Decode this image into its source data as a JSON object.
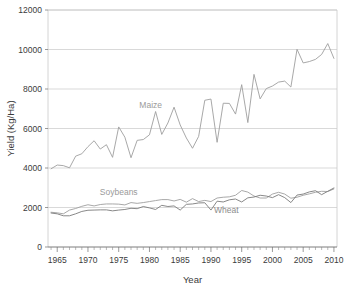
{
  "chart_data": {
    "type": "line",
    "title": "",
    "xlabel": "Year",
    "ylabel": "Yield (Kg/Ha)",
    "xlim": [
      1963.5,
      2010.5
    ],
    "ylim": [
      0,
      12000
    ],
    "grid": true,
    "legend_position": "inline-annotations",
    "x_tick_labels": [
      "1965",
      "1970",
      "1975",
      "1980",
      "1985",
      "1990",
      "1995",
      "2000",
      "2005",
      "2010"
    ],
    "x_ticks": [
      1965,
      1970,
      1975,
      1980,
      1985,
      1990,
      1995,
      2000,
      2005,
      2010
    ],
    "x_minor_tick_interval": 1,
    "y_tick_labels": [
      "0",
      "2000",
      "4000",
      "6000",
      "8000",
      "10000",
      "12000"
    ],
    "y_ticks": [
      0,
      2000,
      4000,
      6000,
      8000,
      10000,
      12000
    ],
    "x": [
      1964,
      1965,
      1966,
      1967,
      1968,
      1969,
      1970,
      1971,
      1972,
      1973,
      1974,
      1975,
      1976,
      1977,
      1978,
      1979,
      1980,
      1981,
      1982,
      1983,
      1984,
      1985,
      1986,
      1987,
      1988,
      1989,
      1990,
      1991,
      1992,
      1993,
      1994,
      1995,
      1996,
      1997,
      1998,
      1999,
      2000,
      2001,
      2002,
      2003,
      2004,
      2005,
      2006,
      2007,
      2008,
      2009,
      2010
    ],
    "series": [
      {
        "name": "Maize",
        "color": "#9e9e9e",
        "label_x": 1980.2,
        "label_y": 7050,
        "values": [
          3960,
          4150,
          4120,
          4010,
          4600,
          4720,
          5080,
          5380,
          4960,
          5180,
          4540,
          6080,
          5560,
          4520,
          5400,
          5440,
          5680,
          6860,
          5700,
          6280,
          7080,
          6180,
          5520,
          5000,
          5600,
          7430,
          7490,
          5300,
          7280,
          7270,
          6730,
          8220,
          6300,
          8740,
          7500,
          8020,
          8150,
          8350,
          8400,
          8100,
          10010,
          9320,
          9390,
          9500,
          9750,
          10300,
          9550
        ]
      },
      {
        "name": "Soybeans",
        "color": "#9e9e9e",
        "label_x": 1975.0,
        "label_y": 2620,
        "values": [
          1760,
          1730,
          1680,
          1870,
          1950,
          2060,
          2140,
          2080,
          2150,
          2180,
          2180,
          2170,
          2130,
          2250,
          2210,
          2250,
          2300,
          2350,
          2400,
          2400,
          2330,
          2410,
          2270,
          2450,
          2300,
          2360,
          2300,
          2480,
          2520,
          2540,
          2620,
          2860,
          2780,
          2580,
          2480,
          2480,
          2680,
          2770,
          2680,
          2470,
          2520,
          2620,
          2690,
          2770,
          2820,
          2810,
          2940
        ]
      },
      {
        "name": "Wheat",
        "color": "#7a7a7a",
        "label_x": 1992.5,
        "label_y": 1720,
        "values": [
          1720,
          1680,
          1580,
          1580,
          1680,
          1800,
          1860,
          1870,
          1880,
          1880,
          1830,
          1870,
          1900,
          1960,
          1940,
          2050,
          1980,
          1900,
          2110,
          2050,
          2080,
          1870,
          2160,
          2180,
          2230,
          2240,
          1870,
          2320,
          2280,
          2390,
          2430,
          2280,
          2490,
          2530,
          2620,
          2580,
          2500,
          2650,
          2500,
          2250,
          2630,
          2680,
          2790,
          2850,
          2650,
          2820,
          2990
        ]
      }
    ]
  }
}
